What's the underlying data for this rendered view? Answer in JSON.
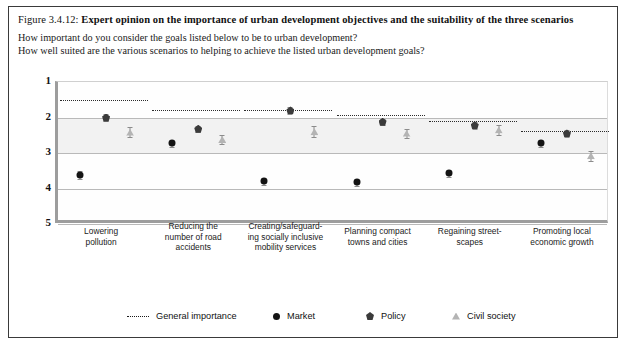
{
  "caption": {
    "number": "Figure 3.4.12: ",
    "title": "Expert opinion on the importance of urban development objectives and the suitability of the three scenarios"
  },
  "questions": {
    "q1": "How important do you consider the goals listed below to be to urban development?",
    "q2": "How well suited are the various scenarios to helping to achieve the listed urban development goals?"
  },
  "legend": {
    "importance": "General importance",
    "market": "Market",
    "policy": "Policy",
    "civil": "Civil society"
  },
  "colors": {
    "market": "#141414",
    "policy": "#3b3b3b",
    "civil": "#b4b4b4",
    "importance": "#2b2b2b",
    "band": "#f2f2f2",
    "grid": "#b9b9b9",
    "axis": "#9d9d9d"
  },
  "chart_data": {
    "type": "scatter",
    "title": "Expert opinion on the importance of urban development objectives and the suitability of the three scenarios",
    "xlabel": "",
    "ylabel": "",
    "ylim": [
      1,
      5
    ],
    "y_inverted": true,
    "yticks": [
      1,
      2,
      3,
      4,
      5
    ],
    "ytick_labels": [
      "1",
      "2",
      "3",
      "4",
      "5"
    ],
    "grid": true,
    "legend_position": "bottom",
    "categories": [
      "Lowering pollution",
      "Reducing the number of road accidents",
      "Creating/safeguarding socially inclusive mobility services",
      "Planning compact towns and cities",
      "Regaining street-scapes",
      "Promoting local economic growth"
    ],
    "category_lines": [
      [
        "Lowering",
        "pollution"
      ],
      [
        "Reducing the",
        "number of road",
        "accidents"
      ],
      [
        "Creating/safeguard-",
        "ing socially inclusive",
        "mobility services"
      ],
      [
        "Planning compact",
        "towns and cities"
      ],
      [
        "Regaining street-",
        "scapes"
      ],
      [
        "Promoting local",
        "economic growth"
      ]
    ],
    "series": [
      {
        "name": "Market",
        "marker": "circle",
        "values": [
          3.62,
          2.72,
          3.8,
          3.82,
          3.57,
          2.72
        ],
        "errors": [
          0.1,
          0.1,
          0.1,
          0.1,
          0.1,
          0.1
        ]
      },
      {
        "name": "Policy",
        "marker": "pentagon",
        "values": [
          2.0,
          2.32,
          1.8,
          2.12,
          2.22,
          2.45
        ],
        "errors": [
          0.09,
          0.09,
          0.09,
          0.09,
          0.09,
          0.09
        ]
      },
      {
        "name": "Civil society",
        "marker": "triangle",
        "values": [
          2.42,
          2.62,
          2.4,
          2.45,
          2.35,
          3.08
        ],
        "errors": [
          0.14,
          0.14,
          0.16,
          0.14,
          0.14,
          0.14
        ]
      }
    ],
    "importance_line": {
      "name": "General importance",
      "style": "dotted",
      "values": [
        1.52,
        1.8,
        1.8,
        1.92,
        2.1,
        2.38
      ]
    }
  }
}
